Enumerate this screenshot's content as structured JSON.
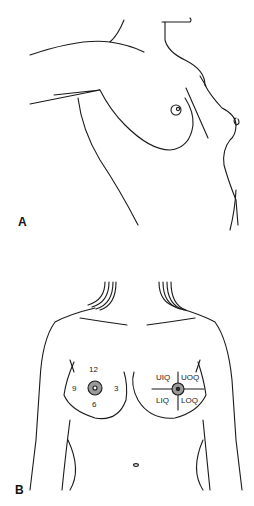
{
  "figure": {
    "panels": [
      {
        "id": "A",
        "label": "A",
        "description": "Lateral view of breast with arm raised"
      },
      {
        "id": "B",
        "label": "B",
        "description": "Frontal view of chest showing clock positions and quadrants"
      }
    ],
    "clock_positions": {
      "top": "12",
      "left": "9",
      "right": "3",
      "bottom": "6"
    },
    "quadrants": {
      "upper_inner": "UIQ",
      "upper_outer": "UOQ",
      "lower_inner": "LIQ",
      "lower_outer": "LOQ"
    },
    "colors": {
      "line": "#1a1a1a",
      "areola_fill": "#9a9a9a"
    }
  }
}
